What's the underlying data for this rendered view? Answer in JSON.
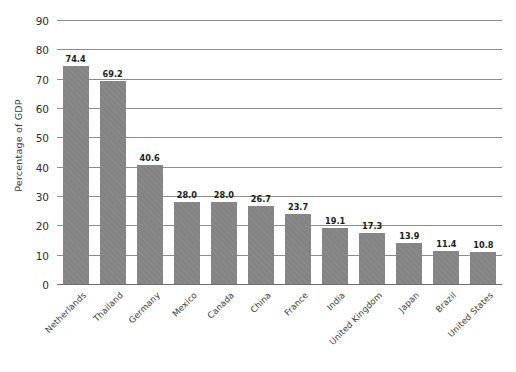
{
  "chart_data": {
    "type": "bar",
    "title": "",
    "xlabel": "",
    "ylabel": "Percentage of GDP",
    "ylim": [
      0,
      90
    ],
    "ytick_step": 10,
    "yticks": [
      90,
      80,
      70,
      60,
      50,
      40,
      30,
      20,
      10,
      0
    ],
    "grid": true,
    "legend": "none",
    "bar_color": "#848484",
    "gridline_color": "#8c8c8c",
    "categories": [
      "Netherlands",
      "Thailand",
      "Germany",
      "Mexico",
      "Canada",
      "China",
      "France",
      "India",
      "United Kingdom",
      "Japan",
      "Brazil",
      "United States"
    ],
    "values": [
      74.4,
      69.2,
      40.6,
      28.0,
      28.0,
      26.7,
      23.7,
      19.1,
      17.3,
      13.9,
      11.4,
      10.8
    ],
    "value_labels": [
      "74.4",
      "69.2",
      "40.6",
      "28.0",
      "28.0",
      "26.7",
      "23.7",
      "19.1",
      "17.3",
      "13.9",
      "11.4",
      "10.8"
    ]
  }
}
